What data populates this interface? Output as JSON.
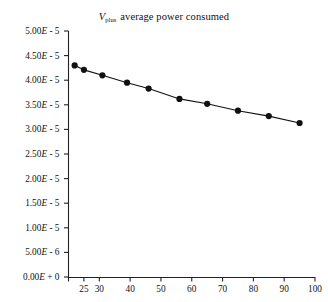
{
  "chart_data": {
    "type": "line",
    "title_parts": {
      "symbol": "V",
      "subscript": "plus",
      "rest": "average power consumed"
    },
    "xlabel": "",
    "ylabel": "",
    "xlim": [
      20,
      100
    ],
    "ylim": [
      0,
      5e-05
    ],
    "grid": false,
    "legend": null,
    "marker": "filled-circle",
    "line_color": "#111111",
    "marker_color": "#111111",
    "background_color": "#ffffff",
    "x": [
      22,
      25,
      31,
      39,
      46,
      56,
      65,
      75,
      85,
      95
    ],
    "values": [
      4.3e-05,
      4.21e-05,
      4.1e-05,
      3.95e-05,
      3.83e-05,
      3.62e-05,
      3.52e-05,
      3.38e-05,
      3.27e-05,
      3.13e-05
    ],
    "points": [
      {
        "x": 22,
        "y": 4.3e-05
      },
      {
        "x": 25,
        "y": 4.21e-05
      },
      {
        "x": 31,
        "y": 4.1e-05
      },
      {
        "x": 39,
        "y": 3.95e-05
      },
      {
        "x": 46,
        "y": 3.83e-05
      },
      {
        "x": 56,
        "y": 3.62e-05
      },
      {
        "x": 65,
        "y": 3.52e-05
      },
      {
        "x": 75,
        "y": 3.38e-05
      },
      {
        "x": 85,
        "y": 3.27e-05
      },
      {
        "x": 95,
        "y": 3.13e-05
      }
    ],
    "yticks": [
      0,
      5e-06,
      1e-05,
      1.5e-05,
      2e-05,
      2.5e-05,
      3e-05,
      3.5e-05,
      4e-05,
      4.5e-05,
      5e-05
    ],
    "ytick_labels": [
      "0.00E + 0",
      "5.00E - 6",
      "1.00E - 5",
      "1.50E - 5",
      "2.00E - 5",
      "2.50E - 5",
      "3.00E - 5",
      "3.50E - 5",
      "4.00E - 5",
      "4.50E - 5",
      "5.00E - 5"
    ],
    "xticks": [
      20,
      25,
      30,
      40,
      50,
      60,
      70,
      80,
      90,
      100
    ],
    "xtick_labels": [
      "",
      "25",
      "30",
      "40",
      "50",
      "60",
      "70",
      "80",
      "90",
      "100"
    ]
  }
}
